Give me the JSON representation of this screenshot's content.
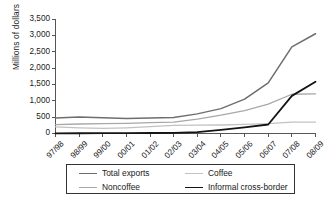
{
  "chart_data": {
    "type": "line",
    "title": "",
    "xlabel": "",
    "ylabel": "Millions of dollars",
    "categories": [
      "97/98",
      "98/99",
      "99/00",
      "00/01",
      "01/02",
      "02/03",
      "03/04",
      "04/05",
      "05/06",
      "06/07",
      "07/08",
      "08/09"
    ],
    "ylim": [
      0,
      3500
    ],
    "yticks": [
      0,
      500,
      1000,
      1500,
      2000,
      2500,
      3000,
      3500
    ],
    "ytick_labels": [
      "0",
      "500",
      "1,000",
      "1,500",
      "2,000",
      "2,500",
      "3,000",
      "3,500"
    ],
    "grid": false,
    "legend_position": "bottom",
    "series": [
      {
        "name": "Total exports",
        "color": "#6e6e6e",
        "width": 1.5,
        "values": [
          475,
          505,
          480,
          455,
          470,
          490,
          600,
          760,
          1050,
          1550,
          2650,
          3050
        ]
      },
      {
        "name": "Coffee",
        "color": "#c2c2c2",
        "width": 1.3,
        "values": [
          200,
          175,
          155,
          175,
          210,
          250,
          255,
          260,
          280,
          300,
          350,
          350
        ]
      },
      {
        "name": "Noncoffee",
        "color": "#a8a8a8",
        "width": 1.3,
        "values": [
          270,
          290,
          300,
          310,
          330,
          345,
          440,
          560,
          700,
          900,
          1200,
          1210
        ]
      },
      {
        "name": "Informal cross-border",
        "color": "#141414",
        "width": 1.8,
        "values": [
          5,
          8,
          10,
          12,
          15,
          20,
          45,
          110,
          190,
          275,
          1150,
          1580
        ]
      }
    ]
  },
  "axis": {
    "y_title": "Millions of dollars"
  },
  "legend": {
    "entries": [
      {
        "label": "Total exports",
        "series": 0
      },
      {
        "label": "Coffee",
        "series": 1
      },
      {
        "label": "Noncoffee",
        "series": 2
      },
      {
        "label": "Informal cross-border",
        "series": 3
      }
    ]
  }
}
